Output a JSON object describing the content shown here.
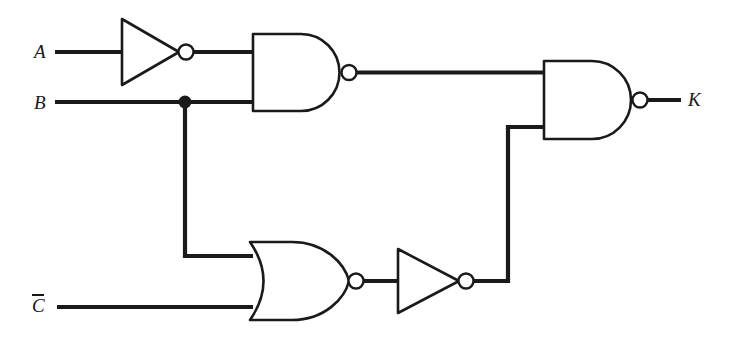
{
  "diagram": {
    "type": "logic-gate-schematic",
    "background_color": "#ffffff",
    "line_color": "#1a1a1a",
    "inputs": [
      {
        "id": "A",
        "label": "A",
        "overbar": false,
        "x": 38,
        "y": 52
      },
      {
        "id": "B",
        "label": "B",
        "overbar": false,
        "x": 38,
        "y": 103
      },
      {
        "id": "C",
        "label": "C",
        "overbar": true,
        "x": 35,
        "y": 306
      }
    ],
    "outputs": [
      {
        "id": "K",
        "label": "K",
        "overbar": false,
        "x": 690,
        "y": 99
      }
    ],
    "gates": [
      {
        "id": "inv1",
        "type": "NOT",
        "label": "inverter",
        "inputs": [
          "A"
        ],
        "output": "nA"
      },
      {
        "id": "nand1",
        "type": "NAND",
        "label": "nand-gate",
        "inputs": [
          "nA",
          "B"
        ],
        "output": "n1"
      },
      {
        "id": "nor1",
        "type": "NOR",
        "label": "nor-gate",
        "inputs": [
          "B",
          "C"
        ],
        "output": "n2"
      },
      {
        "id": "inv2",
        "type": "NOT",
        "label": "inverter",
        "inputs": [
          "n2"
        ],
        "output": "n3"
      },
      {
        "id": "nand2",
        "type": "NAND",
        "label": "nand-gate",
        "inputs": [
          "n1",
          "n3"
        ],
        "output": "K"
      }
    ],
    "junctions": [
      {
        "id": "b-tap",
        "on_net": "B",
        "x": 185,
        "y": 102
      }
    ]
  }
}
